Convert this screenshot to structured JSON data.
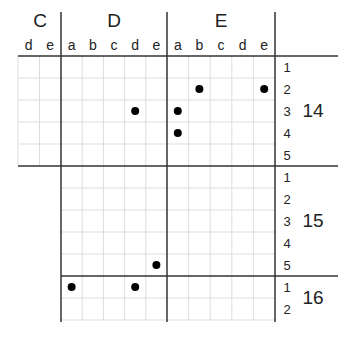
{
  "diagram": {
    "column_groups": [
      {
        "label": "C",
        "columns": [
          "d",
          "e"
        ]
      },
      {
        "label": "D",
        "columns": [
          "a",
          "b",
          "c",
          "d",
          "e"
        ]
      },
      {
        "label": "E",
        "columns": [
          "a",
          "b",
          "c",
          "d",
          "e"
        ]
      }
    ],
    "row_blocks": [
      {
        "label": "14",
        "rows": [
          "1",
          "2",
          "3",
          "4",
          "5"
        ],
        "columns_present": [
          "C",
          "D",
          "E"
        ]
      },
      {
        "label": "15",
        "rows": [
          "1",
          "2",
          "3",
          "4",
          "5"
        ],
        "columns_present": [
          "D",
          "E"
        ]
      },
      {
        "label": "16",
        "rows": [
          "1",
          "2"
        ],
        "columns_present": [
          "D",
          "E"
        ]
      }
    ],
    "dots": [
      {
        "block": "14",
        "row": "2",
        "group": "E",
        "col": "b"
      },
      {
        "block": "14",
        "row": "2",
        "group": "E",
        "col": "e"
      },
      {
        "block": "14",
        "row": "3",
        "group": "D",
        "col": "d"
      },
      {
        "block": "14",
        "row": "3",
        "group": "E",
        "col": "a"
      },
      {
        "block": "14",
        "row": "4",
        "group": "E",
        "col": "a"
      },
      {
        "block": "15",
        "row": "5",
        "group": "D",
        "col": "e"
      },
      {
        "block": "16",
        "row": "1",
        "group": "D",
        "col": "a"
      },
      {
        "block": "16",
        "row": "1",
        "group": "D",
        "col": "d"
      }
    ],
    "colors": {
      "thick_line": "#333333",
      "thin_line": "#dddddd",
      "dot": "#000000",
      "text": "#222222"
    }
  }
}
